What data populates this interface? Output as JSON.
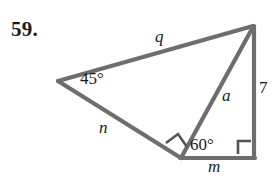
{
  "figure": {
    "problem_number": "59.",
    "stroke_color": "#6e6e6e",
    "stroke_width": 4,
    "mark_color": "#555555",
    "background_color": "#ffffff",
    "text_color": "#1a1a1a",
    "vertices": {
      "left": {
        "x": 58,
        "y": 81
      },
      "top_right": {
        "x": 253,
        "y": 26
      },
      "bottom_middle": {
        "x": 180,
        "y": 158
      },
      "bottom_right": {
        "x": 254,
        "y": 158
      }
    },
    "segments": [
      {
        "name": "q",
        "from": "left",
        "to": "top_right"
      },
      {
        "name": "n",
        "from": "left",
        "to": "bottom_middle"
      },
      {
        "name": "a",
        "from": "bottom_middle",
        "to": "top_right"
      },
      {
        "name": "m",
        "from": "bottom_middle",
        "to": "bottom_right"
      },
      {
        "name": "7",
        "from": "bottom_right",
        "to": "top_right"
      }
    ],
    "labels": {
      "side_q": "q",
      "side_n": "n",
      "side_a": "a",
      "side_m": "m",
      "side_7": "7",
      "angle_45": "45°",
      "angle_60": "60°"
    },
    "right_angle_marks": [
      {
        "name": "right-angle-at-bottom-middle",
        "vertex": "bottom_middle"
      },
      {
        "name": "right-angle-at-bottom-right",
        "vertex": "bottom_right"
      }
    ]
  }
}
